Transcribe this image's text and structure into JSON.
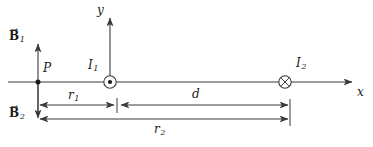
{
  "figure": {
    "type": "physics-diagram",
    "background_color": "#ffffff",
    "line_color": "#3a3a3a",
    "text_color": "#1a1a1a"
  },
  "axes": {
    "x_label": "x",
    "y_label": "y",
    "origin_x": 110,
    "origin_y": 82
  },
  "points": {
    "p_label": "P"
  },
  "currents": [
    {
      "label": "I",
      "subscript": "1",
      "direction": "out-of-page",
      "symbol": "circle-dot",
      "x": 110
    },
    {
      "label": "I",
      "subscript": "2",
      "direction": "into-page",
      "symbol": "circle-cross",
      "x": 285
    }
  ],
  "fields": [
    {
      "label": "B",
      "subscript": "1",
      "arrow": "→",
      "direction": "up",
      "at": "P"
    },
    {
      "label": "B",
      "subscript": "2",
      "arrow": "→",
      "direction": "down",
      "at": "P"
    }
  ],
  "dimensions": [
    {
      "label": "r",
      "subscript": "1",
      "from": "P",
      "to": "I1",
      "style": "double-arrow"
    },
    {
      "label": "d",
      "subscript": "",
      "from": "I1",
      "to": "I2",
      "style": "double-arrow"
    },
    {
      "label": "r",
      "subscript": "2",
      "from": "P",
      "to": "I2",
      "style": "double-arrow"
    }
  ]
}
